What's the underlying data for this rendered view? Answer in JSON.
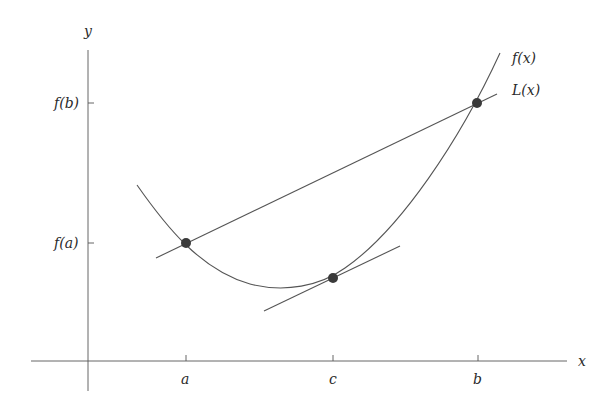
{
  "diagram": {
    "axes": {
      "x_label": "x",
      "y_label": "y",
      "x_ticks": [
        {
          "id": "a",
          "label": "a"
        },
        {
          "id": "c",
          "label": "c"
        },
        {
          "id": "b",
          "label": "b"
        }
      ],
      "y_ticks": [
        {
          "id": "fa",
          "label": "f(a)"
        },
        {
          "id": "fb",
          "label": "f(b)"
        }
      ]
    },
    "curves": [
      {
        "id": "f",
        "label": "f(x)",
        "kind": "convex curve"
      },
      {
        "id": "L",
        "label": "L(x)",
        "kind": "secant line through (a,f(a)) and (b,f(b))"
      },
      {
        "id": "tangent",
        "label": "",
        "kind": "tangent line at c, parallel to secant"
      }
    ],
    "points": [
      {
        "id": "A",
        "at": "(a, f(a))"
      },
      {
        "id": "C",
        "at": "(c, f(c))"
      },
      {
        "id": "B",
        "at": "(b, f(b))"
      }
    ],
    "colors": {
      "line": "#555555",
      "point": "#3a3a3a",
      "text": "#2a2a2a"
    }
  }
}
